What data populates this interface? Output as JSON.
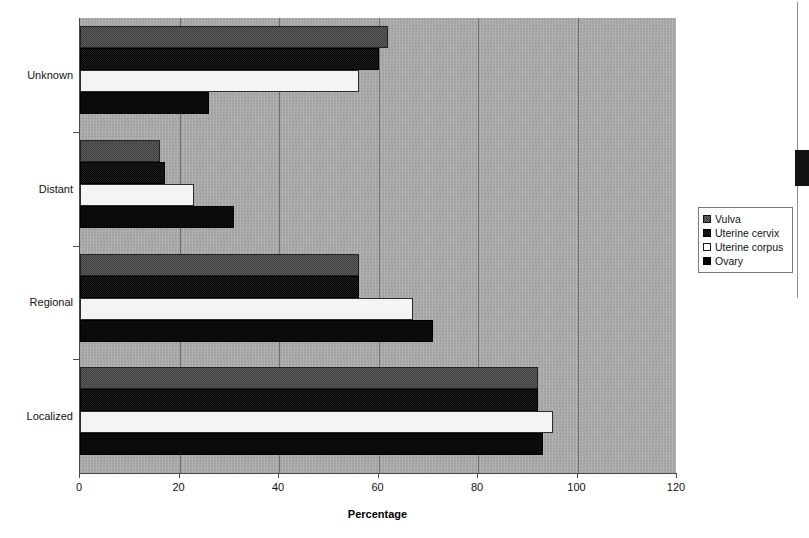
{
  "chart_data": {
    "type": "bar",
    "orientation": "horizontal",
    "title": "",
    "xlabel": "Percentage",
    "ylabel": "",
    "categories": [
      "Localized",
      "Regional",
      "Distant",
      "Unknown"
    ],
    "series": [
      {
        "name": "Vulva",
        "values": [
          92,
          56,
          16,
          62
        ]
      },
      {
        "name": "Uterine cervix",
        "values": [
          92,
          56,
          17,
          60
        ]
      },
      {
        "name": "Uterine corpus",
        "values": [
          95,
          67,
          23,
          56
        ]
      },
      {
        "name": "Ovary",
        "values": [
          93,
          71,
          31,
          26
        ]
      }
    ],
    "xlim": [
      0,
      120
    ],
    "xticks": [
      0,
      20,
      40,
      60,
      80,
      100,
      120
    ],
    "xtick_labels": [
      "0",
      "20",
      "40",
      "60",
      "80",
      "100",
      "120"
    ],
    "grid": true,
    "grid_axis": "x",
    "legend_position": "right",
    "plot_background_color": "#a8a8a8",
    "series_colors": [
      "#4f4f4f",
      "#141414",
      "#f4f4f4",
      "#0b0b0b"
    ]
  },
  "axis": {
    "x_title": "Percentage",
    "tick_labels": [
      "0",
      "20",
      "40",
      "60",
      "80",
      "100",
      "120"
    ],
    "category_labels": [
      "Unknown",
      "Distant",
      "Regional",
      "Localized"
    ]
  },
  "legend": {
    "items": [
      {
        "label": "Vulva"
      },
      {
        "label": "Uterine cervix"
      },
      {
        "label": "Uterine corpus"
      },
      {
        "label": "Ovary"
      }
    ]
  }
}
